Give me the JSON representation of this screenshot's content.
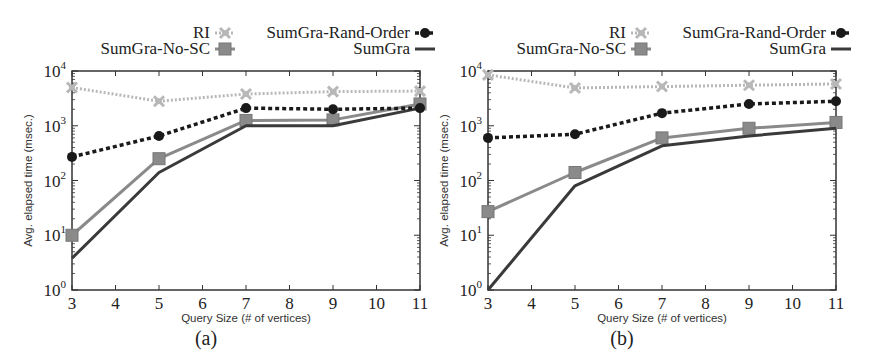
{
  "panels": [
    {
      "id": "a",
      "caption": "(a)",
      "xlabel": "Query Size (# of vertices)",
      "ylabel": "Avg. elapsed time (msec.)"
    },
    {
      "id": "b",
      "caption": "(b)",
      "xlabel": "Query Size (# of vertices)",
      "ylabel": "Avg. elapsed time (msec.)"
    }
  ],
  "legend": {
    "ri": "RI",
    "rand_order": "SumGra-Rand-Order",
    "no_sc": "SumGra-No-SC",
    "sumgra": "SumGra"
  },
  "ticks": {
    "x": [
      "3",
      "4",
      "5",
      "6",
      "7",
      "8",
      "9",
      "10",
      "11"
    ],
    "y": [
      "10",
      "10",
      "10",
      "10",
      "10"
    ],
    "y_exp": [
      "0",
      "1",
      "2",
      "3",
      "4"
    ]
  },
  "colors": {
    "ri": "#b8b8b8",
    "rand_order": "#1a1a1a",
    "no_sc": "#8a8a8a",
    "sumgra": "#3a3a3a"
  },
  "chart_data": [
    {
      "type": "line",
      "title": "(a)",
      "xlabel": "Query Size (# of vertices)",
      "ylabel": "Avg. elapsed time (msec.)",
      "yscale": "log",
      "ylim": [
        1,
        10000
      ],
      "xlim": [
        3,
        11
      ],
      "x": [
        3,
        5,
        7,
        9,
        11
      ],
      "x_ticks": [
        3,
        4,
        5,
        6,
        7,
        8,
        9,
        10,
        11
      ],
      "y_ticks": [
        "10^0",
        "10^1",
        "10^2",
        "10^3",
        "10^4"
      ],
      "legend_position": "top",
      "grid": false,
      "series": [
        {
          "name": "RI",
          "values": [
            5000,
            2800,
            3800,
            4200,
            4300
          ]
        },
        {
          "name": "SumGra-Rand-Order",
          "values": [
            270,
            650,
            2100,
            2000,
            2100
          ]
        },
        {
          "name": "SumGra-No-SC",
          "values": [
            10,
            250,
            1250,
            1280,
            2500
          ]
        },
        {
          "name": "SumGra",
          "values": [
            3.8,
            140,
            1000,
            1000,
            2100
          ]
        }
      ]
    },
    {
      "type": "line",
      "title": "(b)",
      "xlabel": "Query Size (# of vertices)",
      "ylabel": "Avg. elapsed time (msec.)",
      "yscale": "log",
      "ylim": [
        1,
        10000
      ],
      "xlim": [
        3,
        11
      ],
      "x": [
        3,
        5,
        7,
        9,
        11
      ],
      "x_ticks": [
        3,
        4,
        5,
        6,
        7,
        8,
        9,
        10,
        11
      ],
      "y_ticks": [
        "10^0",
        "10^1",
        "10^2",
        "10^3",
        "10^4"
      ],
      "legend_position": "top",
      "grid": false,
      "series": [
        {
          "name": "RI",
          "values": [
            8500,
            4900,
            5200,
            5500,
            5800
          ]
        },
        {
          "name": "SumGra-Rand-Order",
          "values": [
            600,
            700,
            1700,
            2500,
            2800
          ]
        },
        {
          "name": "SumGra-No-SC",
          "values": [
            27,
            140,
            600,
            900,
            1150
          ]
        },
        {
          "name": "SumGra",
          "values": [
            1,
            80,
            430,
            650,
            900
          ]
        }
      ]
    }
  ]
}
